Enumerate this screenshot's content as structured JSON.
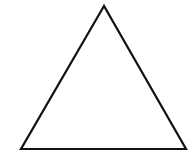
{
  "diagram": {
    "shape": "triangle",
    "type": "equilateral-outline",
    "vertices": [
      [
        104,
        6
      ],
      [
        21,
        149
      ],
      [
        186,
        149
      ]
    ],
    "stroke_color": "#111111",
    "stroke_width": 2.2,
    "fill": "none",
    "background": "#ffffff"
  }
}
